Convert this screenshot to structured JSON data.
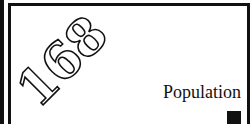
{
  "page": {
    "number": "168",
    "section_title": "Population"
  },
  "colors": {
    "ink": "#111111",
    "background": "#ffffff"
  }
}
